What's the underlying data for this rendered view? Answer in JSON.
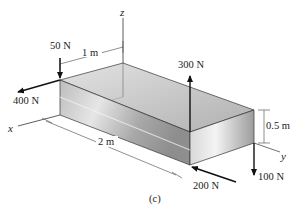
{
  "figure": {
    "caption": "(c)",
    "axes": {
      "x": "x",
      "y": "y",
      "z": "z"
    },
    "dimensions": {
      "width_top": "1 m",
      "length": "2 m",
      "height": "0.5 m"
    },
    "forces": [
      {
        "id": "f50",
        "label": "50 N",
        "direction": "down"
      },
      {
        "id": "f400",
        "label": "400 N",
        "direction": "along -y (toward viewer-left)"
      },
      {
        "id": "f300",
        "label": "300 N",
        "direction": "up"
      },
      {
        "id": "f200",
        "label": "200 N",
        "direction": "toward box along x"
      },
      {
        "id": "f100",
        "label": "100 N",
        "direction": "down"
      }
    ],
    "colors": {
      "line": "#222222",
      "box_light": "#f2f2f2",
      "box_mid": "#cfcfcf",
      "box_dark": "#9a9a9a"
    }
  }
}
